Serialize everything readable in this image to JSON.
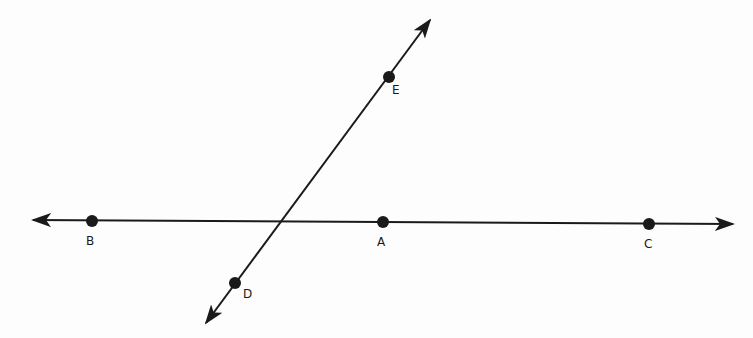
{
  "diagram": {
    "type": "geometry-lines",
    "color": "#1a1a1a",
    "lines": [
      {
        "name": "line-BC",
        "from": [
          33,
          220
        ],
        "to": [
          733,
          224
        ]
      },
      {
        "name": "line-DE",
        "from": [
          206,
          323
        ],
        "to": [
          430,
          20
        ]
      }
    ],
    "points": [
      {
        "label": "B",
        "x": 92,
        "y": 221,
        "lx": 86,
        "ly": 245
      },
      {
        "label": "A",
        "x": 383,
        "y": 222,
        "lx": 377,
        "ly": 246
      },
      {
        "label": "C",
        "x": 649,
        "y": 224,
        "lx": 644,
        "ly": 248
      },
      {
        "label": "E",
        "x": 389,
        "y": 77,
        "lx": 392,
        "ly": 94
      },
      {
        "label": "D",
        "x": 235,
        "y": 283,
        "lx": 243,
        "ly": 298
      }
    ]
  }
}
